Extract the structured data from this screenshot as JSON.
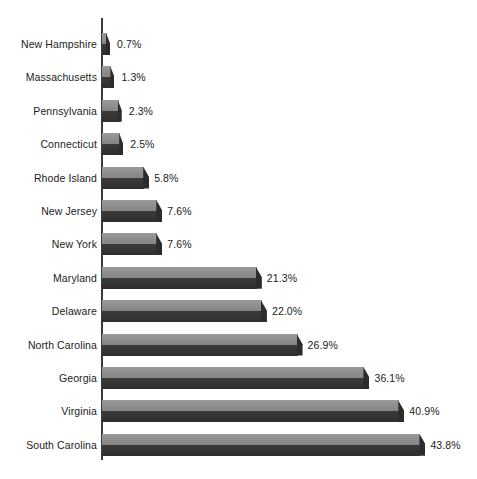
{
  "chart_data": {
    "type": "bar",
    "orientation": "horizontal",
    "title": "",
    "subtitle": "",
    "xlabel": "",
    "ylabel": "",
    "grid": false,
    "legend": false,
    "legend_position": "none",
    "axis_line": true,
    "value_suffix": "%",
    "xlim": [
      0,
      43.8
    ],
    "categories": [
      "New Hampshire",
      "Massachusetts",
      "Pennsylvania",
      "Connecticut",
      "Rhode Island",
      "New Jersey",
      "New York",
      "Maryland",
      "Delaware",
      "North Carolina",
      "Georgia",
      "Virginia",
      "South Carolina"
    ],
    "values": [
      0.7,
      1.3,
      2.3,
      2.5,
      5.8,
      7.6,
      7.6,
      21.3,
      22.0,
      26.9,
      36.1,
      40.9,
      43.8
    ],
    "data_labels": [
      "0.7%",
      "1.3%",
      "2.3%",
      "2.5%",
      "5.8%",
      "7.6%",
      "7.6%",
      "21.3%",
      "22.0%",
      "26.9%",
      "36.1%",
      "40.9%",
      "43.8%"
    ],
    "colors": {
      "bar_top": "#8e8e8e",
      "bar_front": "#343434",
      "bar_cap": "#2c2c2c",
      "axis": "#3b3b3b",
      "text": "#1c1c1c",
      "background": "#ffffff"
    }
  },
  "layout": {
    "axis_x_px": 101,
    "axis_top_px": 18,
    "axis_bottom_px": 460,
    "first_row_center_px": 44,
    "row_pitch_px": 33.4,
    "px_per_percent": 7.27,
    "bar_height_px": 22
  }
}
